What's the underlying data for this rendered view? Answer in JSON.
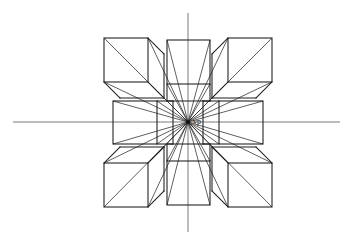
{
  "figure": {
    "type": "line-drawing",
    "background_color": "#ffffff",
    "line_color": "#1c1c1c",
    "axis_color": "#6b6b6b",
    "ray_color": "#2a2a2a"
  },
  "vanishing_point": {
    "label": "vp",
    "x": 188,
    "y": 122,
    "label_offset_x": 5,
    "label_offset_y": 2,
    "dot_radius": 1.8
  },
  "axes": {
    "horizon_line": {
      "name": "horizon-line",
      "x1": 13,
      "y1": 122,
      "x2": 340,
      "y2": 122
    },
    "vertical_line": {
      "name": "vertical-axis-line",
      "x1": 188,
      "y1": 13,
      "x2": 188,
      "y2": 232
    }
  },
  "cubes": [
    {
      "name": "cube-top-left",
      "position": "top-left",
      "face": {
        "x": 104,
        "y": 38,
        "w": 44,
        "h": 44
      },
      "depth": {
        "dx": 16,
        "dy": 16
      },
      "visible_sides": [
        "front",
        "right",
        "bottom"
      ]
    },
    {
      "name": "cube-top-center",
      "position": "top-center",
      "face": {
        "x": 167,
        "y": 40,
        "w": 43,
        "h": 44
      },
      "depth": {
        "dx": 0,
        "dy": 17
      },
      "visible_sides": [
        "front",
        "bottom"
      ]
    },
    {
      "name": "cube-top-right",
      "position": "top-right",
      "face": {
        "x": 228,
        "y": 38,
        "w": 44,
        "h": 44
      },
      "depth": {
        "dx": -16,
        "dy": 16
      },
      "visible_sides": [
        "front",
        "left",
        "bottom"
      ]
    },
    {
      "name": "cube-middle-left",
      "position": "middle-left",
      "face": {
        "x": 113,
        "y": 101,
        "w": 44,
        "h": 43
      },
      "depth": {
        "dx": 16,
        "dy": 0
      },
      "visible_sides": [
        "front",
        "right"
      ]
    },
    {
      "name": "cube-middle-right",
      "position": "middle-right",
      "face": {
        "x": 219,
        "y": 101,
        "w": 44,
        "h": 43
      },
      "depth": {
        "dx": -16,
        "dy": 0
      },
      "visible_sides": [
        "front",
        "left"
      ]
    },
    {
      "name": "cube-bottom-left",
      "position": "bottom-left",
      "face": {
        "x": 104,
        "y": 163,
        "w": 44,
        "h": 44
      },
      "depth": {
        "dx": 16,
        "dy": -16
      },
      "visible_sides": [
        "front",
        "right",
        "top"
      ]
    },
    {
      "name": "cube-bottom-center",
      "position": "bottom-center",
      "face": {
        "x": 167,
        "y": 161,
        "w": 43,
        "h": 44
      },
      "depth": {
        "dx": 0,
        "dy": -17
      },
      "visible_sides": [
        "front",
        "top"
      ]
    },
    {
      "name": "cube-bottom-right",
      "position": "bottom-right",
      "face": {
        "x": 228,
        "y": 163,
        "w": 44,
        "h": 44
      },
      "depth": {
        "dx": -16,
        "dy": -16
      },
      "visible_sides": [
        "front",
        "left",
        "top"
      ]
    }
  ],
  "chart_data": {
    "type": "line-drawing",
    "vanishing_point": [
      188,
      122
    ],
    "horizon_y": 122,
    "vertical_axis_x": 188,
    "cube_grid": "3 x 3 grid with the center cell occupied by the vanishing point",
    "cube_count": 8,
    "cube_face_size_px": 44,
    "annotations": [
      "vp"
    ]
  }
}
